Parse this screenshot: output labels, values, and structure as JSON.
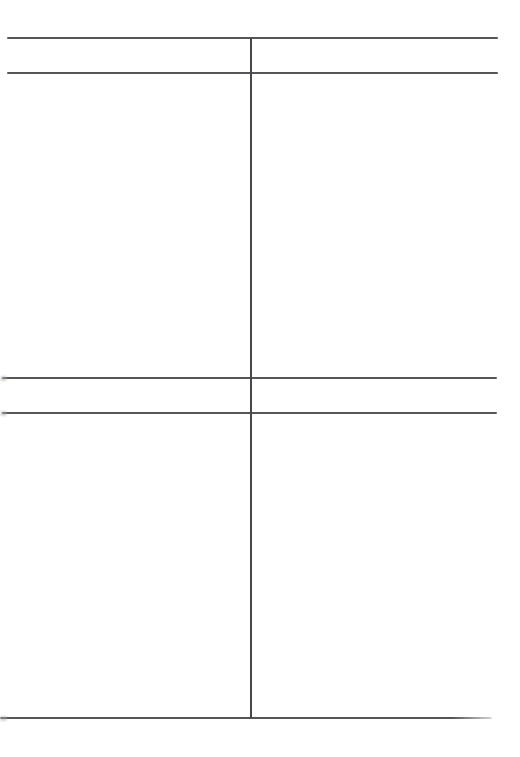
{
  "document": {
    "description": "Scanned blank page with an empty two-column ruled table; no visible text in any cell",
    "background_color": "#ffffff",
    "rule_color": "#55555a",
    "divider_color": "#47474b",
    "smudge_color": "#a8a8ac"
  },
  "grid": {
    "columns": 2,
    "column_divider_x": 251,
    "horizontal_lines": [
      {
        "name": "table-top-rule",
        "y": 38,
        "x1": 7,
        "x2": 498,
        "fade_right": false
      },
      {
        "name": "header-bottom-rule",
        "y": 73,
        "x1": 7,
        "x2": 498,
        "fade_right": false
      },
      {
        "name": "mid-upper-rule",
        "y": 378,
        "x1": 2,
        "x2": 497,
        "fade_right": false
      },
      {
        "name": "mid-lower-rule",
        "y": 413,
        "x1": 2,
        "x2": 497,
        "fade_right": false
      },
      {
        "name": "table-bottom-rule",
        "y": 718,
        "x1": 0,
        "x2": 492,
        "fade_right": true
      }
    ],
    "vertical_lines": [
      {
        "name": "column-divider",
        "x": 251,
        "y1": 38,
        "y2": 718
      }
    ],
    "edge_smudges": [
      {
        "name": "left-edge-smudge-1",
        "y": 378
      },
      {
        "name": "left-edge-smudge-2",
        "y": 413
      },
      {
        "name": "left-edge-smudge-3",
        "y": 718
      }
    ],
    "rows": [
      {
        "name": "header-band",
        "top": 38,
        "bottom": 73,
        "cells": [
          "",
          ""
        ]
      },
      {
        "name": "body-row-1",
        "top": 73,
        "bottom": 378,
        "cells": [
          "",
          ""
        ]
      },
      {
        "name": "middle-band",
        "top": 378,
        "bottom": 413,
        "cells": [
          "",
          ""
        ]
      },
      {
        "name": "body-row-2",
        "top": 413,
        "bottom": 718,
        "cells": [
          "",
          ""
        ]
      }
    ],
    "column_bounds": {
      "left_x1": 7,
      "right_x2": 498
    }
  }
}
